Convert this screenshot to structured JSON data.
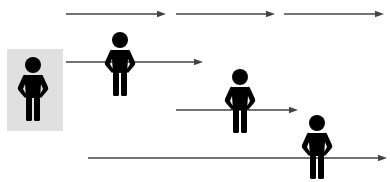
{
  "diagram": {
    "colors": {
      "background": "#ffffff",
      "highlight_box": "#e0e0e0",
      "figure": "#000000",
      "arrow": "#444444"
    },
    "highlight_box": {
      "x": 7,
      "y": 49,
      "width": 56,
      "height": 82
    },
    "figures": [
      {
        "id": "person-1",
        "icon": "person-hands-on-hips-icon",
        "cx": 33,
        "head_cy": 65,
        "highlighted": true
      },
      {
        "id": "person-2",
        "icon": "person-hands-on-hips-icon",
        "cx": 120,
        "head_cy": 40,
        "highlighted": false
      },
      {
        "id": "person-3",
        "icon": "person-hands-on-hips-icon",
        "cx": 240,
        "head_cy": 77,
        "highlighted": false
      },
      {
        "id": "person-4",
        "icon": "person-hands-on-hips-icon",
        "cx": 317,
        "head_cy": 123,
        "highlighted": false
      }
    ],
    "arrows": [
      {
        "id": "arrow-row1-a",
        "x1": 66,
        "x2": 166,
        "y": 14
      },
      {
        "id": "arrow-row1-b",
        "x1": 176,
        "x2": 275,
        "y": 14
      },
      {
        "id": "arrow-row1-c",
        "x1": 284,
        "x2": 384,
        "y": 14
      },
      {
        "id": "arrow-row2",
        "x1": 66,
        "x2": 203,
        "y": 62
      },
      {
        "id": "arrow-row3",
        "x1": 176,
        "x2": 298,
        "y": 110
      },
      {
        "id": "arrow-row4",
        "x1": 88,
        "x2": 387,
        "y": 158
      }
    ]
  }
}
